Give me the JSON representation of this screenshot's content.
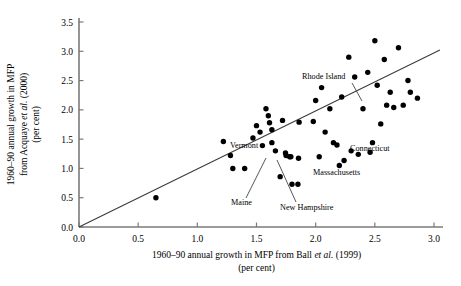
{
  "chart_data": {
    "type": "scatter",
    "title": "",
    "xlabel": "1960–90 annual growth in MFP from Ball et al. (1999) (per cent)",
    "xlabel_line1_pre": "1960–90 annual growth in MFP from Ball ",
    "xlabel_line1_ital": "et al.",
    "xlabel_line1_post": " (1999)",
    "xlabel_line2": "(per cent)",
    "ylabel": "1960–90 annual growth in MFP from Acquaye et al. (2000) (per cent)",
    "ylabel_line1": "1960–90 annual growth in MFP",
    "ylabel_line2_pre": "from Acquaye ",
    "ylabel_line2_ital": "et al.",
    "ylabel_line2_post": " (2000)",
    "ylabel_line3": "(per cent)",
    "xlim": [
      0.0,
      3.0
    ],
    "ylim": [
      0.0,
      3.5
    ],
    "xticks": [
      "0.0",
      "0.5",
      "1.0",
      "1.5",
      "2.0",
      "2.5",
      "3.0"
    ],
    "xtick_values": [
      0.0,
      0.5,
      1.0,
      1.5,
      2.0,
      2.5,
      3.0
    ],
    "yticks": [
      "0.0",
      "0.5",
      "1.0",
      "1.5",
      "2.0",
      "2.5",
      "3.0",
      "3.5"
    ],
    "ytick_values": [
      0.0,
      0.5,
      1.0,
      1.5,
      2.0,
      2.5,
      3.0,
      3.5
    ],
    "grid": false,
    "legend": "none",
    "marker_color": "#000000",
    "line_color": "#3b3b3b",
    "fit_line": {
      "x0": 0.0,
      "y0": 0.0,
      "x1": 3.05,
      "y1": 3.02
    },
    "points": [
      {
        "x": 0.65,
        "y": 0.5
      },
      {
        "x": 1.22,
        "y": 1.46
      },
      {
        "x": 1.28,
        "y": 1.22
      },
      {
        "x": 1.3,
        "y": 1.0
      },
      {
        "x": 1.4,
        "y": 1.0
      },
      {
        "x": 1.47,
        "y": 1.52
      },
      {
        "x": 1.5,
        "y": 1.73
      },
      {
        "x": 1.53,
        "y": 1.62
      },
      {
        "x": 1.55,
        "y": 1.39
      },
      {
        "x": 1.58,
        "y": 2.02
      },
      {
        "x": 1.6,
        "y": 1.9
      },
      {
        "x": 1.61,
        "y": 1.78
      },
      {
        "x": 1.63,
        "y": 1.66
      },
      {
        "x": 1.63,
        "y": 1.44
      },
      {
        "x": 1.66,
        "y": 1.3
      },
      {
        "x": 1.7,
        "y": 0.86
      },
      {
        "x": 1.72,
        "y": 1.82
      },
      {
        "x": 1.75,
        "y": 1.22
      },
      {
        "x": 1.78,
        "y": 1.2
      },
      {
        "x": 1.8,
        "y": 0.73
      },
      {
        "x": 1.85,
        "y": 0.73
      },
      {
        "x": 1.86,
        "y": 1.79
      },
      {
        "x": 1.98,
        "y": 1.8
      },
      {
        "x": 2.0,
        "y": 2.16
      },
      {
        "x": 2.03,
        "y": 1.2
      },
      {
        "x": 2.05,
        "y": 2.38
      },
      {
        "x": 2.08,
        "y": 1.62
      },
      {
        "x": 2.12,
        "y": 2.02
      },
      {
        "x": 2.15,
        "y": 1.44
      },
      {
        "x": 2.18,
        "y": 1.4
      },
      {
        "x": 2.2,
        "y": 1.05
      },
      {
        "x": 2.22,
        "y": 2.22
      },
      {
        "x": 2.28,
        "y": 2.9
      },
      {
        "x": 2.3,
        "y": 1.3
      },
      {
        "x": 2.33,
        "y": 2.56
      },
      {
        "x": 2.36,
        "y": 1.24
      },
      {
        "x": 2.4,
        "y": 2.02
      },
      {
        "x": 2.44,
        "y": 2.64
      },
      {
        "x": 2.48,
        "y": 1.44
      },
      {
        "x": 2.5,
        "y": 3.18
      },
      {
        "x": 2.52,
        "y": 2.42
      },
      {
        "x": 2.55,
        "y": 1.76
      },
      {
        "x": 2.58,
        "y": 2.86
      },
      {
        "x": 2.6,
        "y": 2.08
      },
      {
        "x": 2.63,
        "y": 2.3
      },
      {
        "x": 2.66,
        "y": 2.04
      },
      {
        "x": 2.7,
        "y": 3.06
      },
      {
        "x": 2.74,
        "y": 2.08
      },
      {
        "x": 2.78,
        "y": 2.5
      },
      {
        "x": 2.8,
        "y": 2.3
      },
      {
        "x": 2.86,
        "y": 2.2
      }
    ],
    "annotations": [
      {
        "name": "rhode-island",
        "text": "Rhode Island",
        "tx": 302,
        "ty": 79,
        "anchor": "start",
        "lx1": 352,
        "ly1": 83,
        "lx2": 362,
        "ly2": 101
      },
      {
        "name": "vermont",
        "text": "Vermont",
        "tx": 230,
        "ty": 148,
        "anchor": "start",
        "lx1": 0,
        "ly1": 0,
        "lx2": 0,
        "ly2": 0
      },
      {
        "name": "maine",
        "text": "Maine",
        "tx": 231,
        "ty": 205,
        "anchor": "start",
        "lx1": 246,
        "ly1": 198,
        "lx2": 266,
        "ly2": 158
      },
      {
        "name": "new-hampshire",
        "text": "New Hampshire",
        "tx": 280,
        "ty": 210,
        "anchor": "start",
        "lx1": 296,
        "ly1": 202,
        "lx2": 277,
        "ly2": 160
      },
      {
        "name": "massachusetts",
        "text": "Massachusetts",
        "tx": 313,
        "ty": 175,
        "anchor": "start",
        "lx1": 0,
        "ly1": 0,
        "lx2": 0,
        "ly2": 0
      },
      {
        "name": "connecticut",
        "text": "Connecticut",
        "tx": 350,
        "ty": 151,
        "anchor": "start",
        "lx1": 0,
        "ly1": 0,
        "lx2": 0,
        "ly2": 0
      }
    ],
    "labelled_points": [
      {
        "name": "vermont-point",
        "x": 1.745,
        "y": 1.265
      },
      {
        "name": "maine-point",
        "x": 1.79,
        "y": 1.2
      },
      {
        "name": "new-hampshire-point",
        "x": 1.855,
        "y": 1.175
      },
      {
        "name": "massachusetts-point",
        "x": 2.24,
        "y": 1.135
      },
      {
        "name": "connecticut-point",
        "x": 2.46,
        "y": 1.275
      }
    ]
  }
}
